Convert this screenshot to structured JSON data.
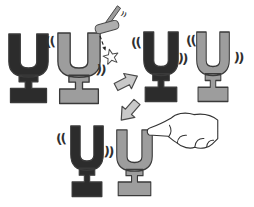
{
  "scene": {
    "background": "#ffffff",
    "colors": {
      "dark_fork": "#2c2c2c",
      "gray_fork": "#9d9d9d",
      "fork_outline": "#3a3a3a",
      "mallet_head": "#aeaeae",
      "mallet_handle": "#9b9b9b",
      "arrow_fill": "#c9c9c9",
      "arrow_outline": "#4a4a4a",
      "star_fill": "#fefefe",
      "hand_fill": "#ffffff",
      "line_dark": "#222222",
      "vibration": "#2f2f2f"
    },
    "marks": {
      "vibration_left": "((",
      "vibration_right": "))",
      "mallet_ticks": "))"
    },
    "icons": {
      "mallet": "mallet-icon",
      "impact_star": "impact-star-icon",
      "flow_arrow_right": "arrow-right-icon",
      "flow_arrow_down_left": "arrow-down-left-icon",
      "pointing_hand": "pointing-hand-icon"
    },
    "panels": {
      "top_left": {
        "left_fork": "dark",
        "right_fork": "gray",
        "event": "mallet strikes gray fork"
      },
      "top_right": {
        "left_fork": "dark",
        "right_fork": "gray",
        "event": "both forks vibrating"
      },
      "bottom": {
        "left_fork": "dark",
        "right_fork": "gray",
        "event": "finger damps gray fork, dark fork still vibrating"
      }
    }
  }
}
